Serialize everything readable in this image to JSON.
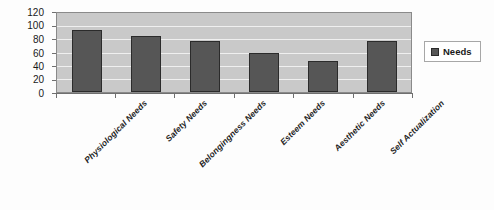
{
  "chart_data": {
    "type": "bar",
    "title": "",
    "xlabel": "",
    "ylabel": "",
    "categories": [
      "Physiological Needs",
      "Safety Needs",
      "Belongingness Needs",
      "Esteem Needs",
      "Aesthetic Needs",
      "Self Actualization"
    ],
    "series": [
      {
        "name": "Needs",
        "values": [
          94,
          85,
          78,
          59,
          47,
          77
        ]
      }
    ],
    "ylim": [
      0,
      120
    ],
    "yticks": [
      0,
      20,
      40,
      60,
      80,
      100,
      120
    ],
    "ytick_labels": [
      "0",
      "20",
      "40",
      "60",
      "80",
      "100",
      "120"
    ],
    "grid": true,
    "legend": {
      "position": "right",
      "entries": [
        "Needs"
      ]
    },
    "colors": {
      "bar": "#565656",
      "bar_border": "#2b2b2b",
      "plot_background": "#c9c9c9",
      "gridline": "#efefef",
      "axis": "#6f6f6f",
      "text": "#1a1a1a",
      "page_background": "#ffffff"
    }
  }
}
